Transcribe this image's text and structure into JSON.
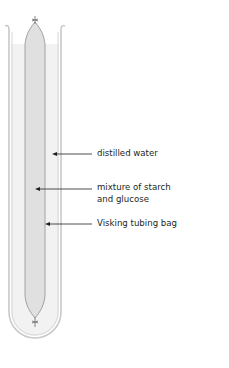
{
  "diagram": {
    "labels": {
      "water": "distilled water",
      "mixture_line1": "mixture of starch",
      "mixture_line2": "and glucose",
      "bag": "Visking tubing bag"
    },
    "colors": {
      "tube_stroke": "#c9c9c9",
      "water_fill": "#f2f2f2",
      "bag_fill": "#e0e0e0",
      "bag_stroke": "#9a9a9a",
      "arrow": "#231f20",
      "text": "#231f20"
    }
  }
}
